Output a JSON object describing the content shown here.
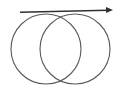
{
  "figure": {
    "name": "two-intersecting-circles-with-tangent-arrow",
    "width": 122,
    "height": 89,
    "background_color": "#ffffff",
    "caption": ""
  },
  "style": {
    "circle_stroke_color": "#5a5a5a",
    "circle_stroke_width": 1.1,
    "circle_fill": "none",
    "arrow_stroke_color": "#303030",
    "arrow_stroke_width": 1.4,
    "arrow_head_fill": "#303030"
  },
  "shapes": {
    "left_circle": {
      "label": "left-circle",
      "cx": 46,
      "cy": 49,
      "r": 35
    },
    "right_circle": {
      "label": "right-circle",
      "cx": 75,
      "cy": 49,
      "r": 35
    },
    "arrow": {
      "label": "horizontal-arrow",
      "x1": 20,
      "y1": 12.2,
      "x2": 108,
      "y2": 10.2,
      "direction": "right",
      "head_tip_x": 113,
      "head_tip_y": 10.1,
      "head_length": 7,
      "head_width": 6
    }
  },
  "intersections": {
    "upper": {
      "label": "upper-intersection-point",
      "x": 60.5,
      "y": 17.5
    },
    "lower": {
      "label": "lower-intersection-point",
      "x": 60.5,
      "y": 80.5
    }
  }
}
